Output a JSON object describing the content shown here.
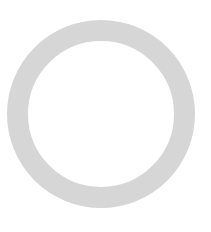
{
  "canvas": {
    "background": "#ffffff"
  },
  "shape": {
    "type": "ring",
    "icon": "circle-outline-icon",
    "color": "#d6d6d6",
    "center_x": 101,
    "center_y": 114,
    "outer_radius": 94,
    "thickness": 21
  }
}
